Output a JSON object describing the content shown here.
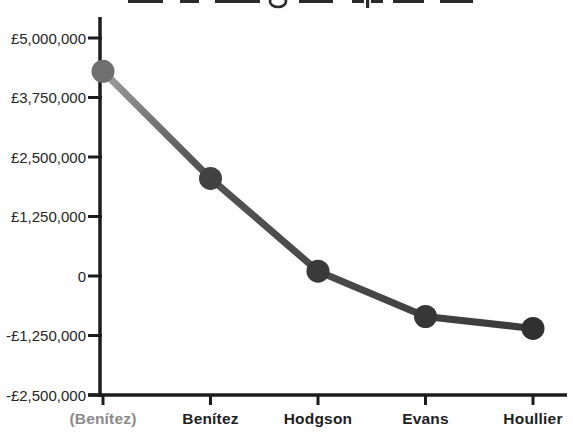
{
  "chart_data": {
    "type": "line",
    "title": "",
    "title_clipped_at_top": true,
    "categories": [
      "(Benítez)",
      "Benítez",
      "Hodgson",
      "Evans",
      "Houllier"
    ],
    "values": [
      4300000,
      2050000,
      100000,
      -850000,
      -1100000
    ],
    "series_name": "net-spend",
    "currency": "£",
    "xlabel": "",
    "ylabel": "",
    "ylim": [
      -2500000,
      5000000
    ],
    "grid": false,
    "legend": false,
    "y_ticks": [
      {
        "value": 5000000,
        "label": "£5,000,000"
      },
      {
        "value": 3750000,
        "label": "£3,750,000"
      },
      {
        "value": 2500000,
        "label": "£2,500,000"
      },
      {
        "value": 1250000,
        "label": "£1,250,000"
      },
      {
        "value": 0,
        "label": "0"
      },
      {
        "value": -1250000,
        "label": "-£1,250,000"
      },
      {
        "value": -2500000,
        "label": "-£2,500,000"
      }
    ],
    "category_label_colors": [
      "#8a8a8a",
      "#1f1f1f",
      "#1f1f1f",
      "#1f1f1f",
      "#1f1f1f"
    ],
    "point_colors": [
      "#6f6f6f",
      "#414141",
      "#3a3a3a",
      "#373737",
      "#303030"
    ],
    "colors": {
      "axis": "#1c1c1c",
      "tick": "#1c1c1c",
      "line_start": "#9e9e9e",
      "line_mid": "#555555",
      "line_end": "#3a3a3a",
      "y_tick_label": "#262626",
      "title_fragment": "#2a2a2a"
    }
  }
}
